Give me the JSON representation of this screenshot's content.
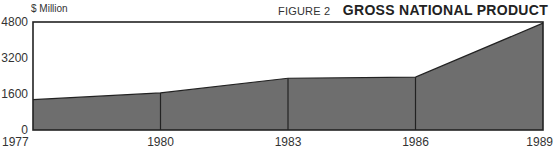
{
  "header": {
    "unit_label": "$ Million",
    "figure_label": "FIGURE 2",
    "title": "GROSS NATIONAL PRODUCT"
  },
  "colors": {
    "fill": "#6e6e6e",
    "line": "#222222",
    "background": "#ffffff"
  },
  "chart_data": {
    "type": "area",
    "title": "GROSS NATIONAL PRODUCT",
    "subtitle": "FIGURE 2",
    "xlabel": "",
    "ylabel": "$ Million",
    "x": [
      "1977",
      "1980",
      "1983",
      "1986",
      "1989"
    ],
    "series": [
      {
        "name": "GNP",
        "values": [
          1350,
          1650,
          2300,
          2350,
          4750
        ]
      }
    ],
    "yticks": [
      0,
      1600,
      3200,
      4800
    ],
    "ylim": [
      0,
      4800
    ],
    "grid": false,
    "legend": "none"
  }
}
